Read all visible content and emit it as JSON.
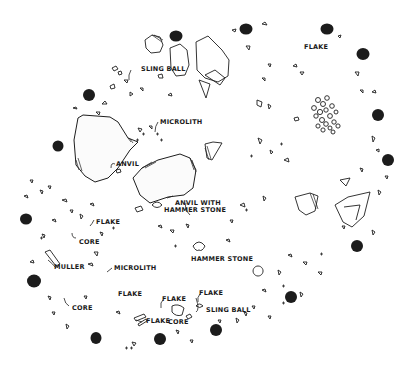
{
  "diagram": {
    "kind": "archaeological floor plan of a circular hut",
    "colors": {
      "ink": "#1c1c1c",
      "background": "#ffffff"
    },
    "labels": {
      "sling_ball_top": "SLING BALL",
      "flake_top": "FLAKE",
      "microlith_top": "MICROLITH",
      "anvil": "ANVIL",
      "anvil_with_1": "ANVIL WITH",
      "anvil_with_2": "HAMMER STONE",
      "hammer_stone": "HAMMER STONE",
      "flake_left": "FLAKE",
      "core_left": "CORE",
      "muller": "MULLER",
      "microlith_bottom": "MICROLITH",
      "flake_mid": "FLAKE",
      "flake_bottom_mid": "FLAKE",
      "flake_bottom_right": "FLAKE",
      "core_bottom_left": "CORE",
      "flake_bottom": "FLAKE",
      "core_bottom": "CORE",
      "sling_ball_bottom": "SLING BALL"
    },
    "post_holes": [
      [
        176,
        36
      ],
      [
        246,
        29
      ],
      [
        327,
        29
      ],
      [
        363,
        54
      ],
      [
        378,
        115
      ],
      [
        388,
        160
      ],
      [
        357,
        246
      ],
      [
        291,
        297
      ],
      [
        216,
        330
      ],
      [
        160,
        339
      ],
      [
        96,
        338
      ],
      [
        34,
        281
      ],
      [
        26,
        219
      ],
      [
        58,
        146
      ],
      [
        89,
        95
      ]
    ]
  }
}
